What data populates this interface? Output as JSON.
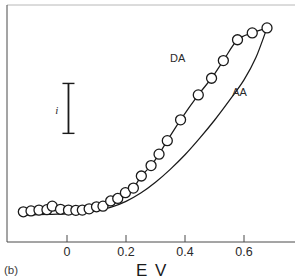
{
  "figure": {
    "panel_caption": "(b)",
    "xaxis_title": "E V",
    "scalebar_label": "i"
  },
  "chart_data": {
    "type": "line",
    "title": "",
    "subtitle": "",
    "xlabel": "E V",
    "ylabel": "i",
    "xlim": [
      -0.15,
      0.7
    ],
    "ylim": [
      0,
      1.05
    ],
    "grid": false,
    "legend_position": "inline-annotations",
    "xticks": [
      0,
      0.2,
      0.4,
      0.6
    ],
    "xticklabels": [
      "0",
      "0.2",
      "0.4",
      "0.6"
    ],
    "yticks": [],
    "yticklabels": [],
    "annotations": [
      {
        "text": "DA",
        "x": 0.375,
        "y": 0.8
      },
      {
        "text": "AA",
        "x": 0.585,
        "y": 0.635
      },
      {
        "text": "i",
        "x": -0.035,
        "y": 0.55
      },
      {
        "text": "(b)",
        "x": -0.145,
        "y": -0.22
      }
    ],
    "scalebar": {
      "label": "i",
      "x": 0.005,
      "y_bottom": 0.455,
      "y_top": 0.695
    },
    "series": [
      {
        "name": "DA",
        "label": "DA",
        "marker": "open-circle",
        "line_style": "solid",
        "color": "#1a1a1a",
        "x": [
          -0.148,
          -0.122,
          -0.095,
          -0.068,
          -0.05,
          -0.022,
          0.005,
          0.03,
          0.052,
          0.075,
          0.1,
          0.122,
          0.148,
          0.172,
          0.198,
          0.225,
          0.252,
          0.285,
          0.312,
          0.34,
          0.385,
          0.445,
          0.49,
          0.53,
          0.578,
          0.628,
          0.678
        ],
        "y": [
          0.078,
          0.082,
          0.086,
          0.088,
          0.105,
          0.09,
          0.086,
          0.085,
          0.086,
          0.092,
          0.102,
          0.105,
          0.13,
          0.142,
          0.17,
          0.192,
          0.25,
          0.3,
          0.355,
          0.42,
          0.52,
          0.64,
          0.72,
          0.805,
          0.905,
          0.938,
          0.962
        ]
      },
      {
        "name": "AA",
        "label": "AA",
        "marker": "none",
        "line_style": "solid",
        "color": "#1a1a1a",
        "x": [
          -0.148,
          -0.1,
          -0.05,
          0.0,
          0.05,
          0.1,
          0.15,
          0.2,
          0.25,
          0.3,
          0.35,
          0.4,
          0.45,
          0.5,
          0.55,
          0.6,
          0.64,
          0.678
        ],
        "y": [
          0.062,
          0.064,
          0.066,
          0.068,
          0.072,
          0.082,
          0.1,
          0.128,
          0.168,
          0.22,
          0.282,
          0.352,
          0.432,
          0.518,
          0.612,
          0.712,
          0.818,
          0.962
        ]
      }
    ]
  }
}
